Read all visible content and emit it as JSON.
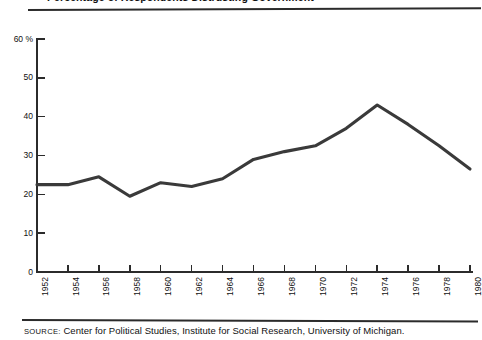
{
  "title": "Percentage of Respondents Distrusting Government",
  "source": {
    "label": "SOURCE:",
    "text": "Center for Political Studies, Institute for Social Research, University of Michigan."
  },
  "axes": {
    "y_unit": "%",
    "y_top_label": "60 %",
    "y_ticks": [
      {
        "value": 60,
        "label": "60 %"
      },
      {
        "value": 50,
        "label": "50"
      },
      {
        "value": 40,
        "label": "40"
      },
      {
        "value": 30,
        "label": "30"
      },
      {
        "value": 20,
        "label": "20"
      },
      {
        "value": 10,
        "label": "10"
      },
      {
        "value": 0,
        "label": "0"
      }
    ],
    "x_ticks": [
      "1952",
      "1954",
      "1956",
      "1958",
      "1960",
      "1962",
      "1964",
      "1966",
      "1968",
      "1970",
      "1972",
      "1974",
      "1976",
      "1978",
      "1980"
    ]
  },
  "chart_data": {
    "type": "line",
    "title": "Percentage of Respondents Distrusting Government",
    "xlabel": "",
    "ylabel": "%",
    "grid": false,
    "legend": false,
    "xlim": [
      1952,
      1980
    ],
    "ylim": [
      0,
      60
    ],
    "x": [
      1952,
      1954,
      1956,
      1958,
      1960,
      1962,
      1964,
      1966,
      1968,
      1970,
      1972,
      1974,
      1976,
      1978,
      1980
    ],
    "series": [
      {
        "name": "Distrust of government",
        "color": "#3a3a3a",
        "values": [
          22.5,
          22.5,
          24.5,
          19.5,
          23.0,
          22.0,
          24.0,
          29.0,
          31.0,
          32.5,
          37.0,
          43.0,
          38.0,
          32.5,
          26.5
        ]
      }
    ]
  }
}
